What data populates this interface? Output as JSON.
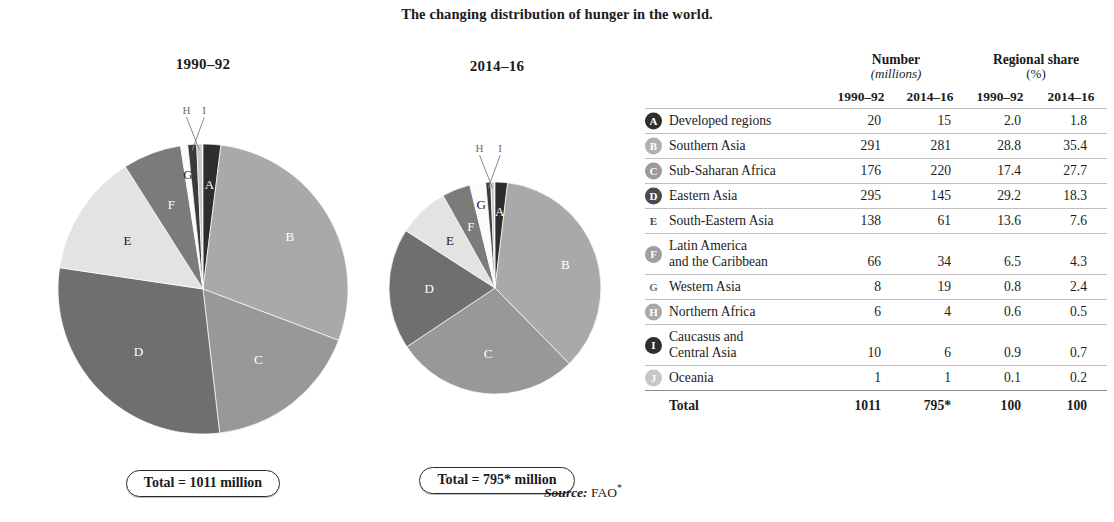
{
  "figure": {
    "title": "The changing distribution of hunger in the world.",
    "source_label": "Source:",
    "source_value": "FAO",
    "source_asterisk": "*"
  },
  "panels": [
    {
      "id": "1990",
      "caption": "1990–92",
      "total_text": "Total = 1011 million"
    },
    {
      "id": "2014",
      "caption": "2014–16",
      "total_text": "Total = 795* million"
    }
  ],
  "table": {
    "group_headers": [
      {
        "title": "Number",
        "sub": "(millions)",
        "sub_italic": true
      },
      {
        "title": "Regional share",
        "sub": "(%)",
        "sub_italic": false
      }
    ],
    "year_headers": [
      "1990–92",
      "2014–16",
      "1990–92",
      "2014–16"
    ],
    "rows": [
      {
        "key": "A",
        "label": "Developed regions",
        "label2": "",
        "n1990": "20",
        "n2014": "15",
        "s1990": "2.0",
        "s2014": "1.8"
      },
      {
        "key": "B",
        "label": "Southern Asia",
        "label2": "",
        "n1990": "291",
        "n2014": "281",
        "s1990": "28.8",
        "s2014": "35.4"
      },
      {
        "key": "C",
        "label": "Sub-Saharan Africa",
        "label2": "",
        "n1990": "176",
        "n2014": "220",
        "s1990": "17.4",
        "s2014": "27.7"
      },
      {
        "key": "D",
        "label": "Eastern Asia",
        "label2": "",
        "n1990": "295",
        "n2014": "145",
        "s1990": "29.2",
        "s2014": "18.3"
      },
      {
        "key": "E",
        "label": "South-Eastern Asia",
        "label2": "",
        "n1990": "138",
        "n2014": "61",
        "s1990": "13.6",
        "s2014": "7.6"
      },
      {
        "key": "F",
        "label": "Latin America",
        "label2": "and the Caribbean",
        "n1990": "66",
        "n2014": "34",
        "s1990": "6.5",
        "s2014": "4.3"
      },
      {
        "key": "G",
        "label": "Western Asia",
        "label2": "",
        "n1990": "8",
        "n2014": "19",
        "s1990": "0.8",
        "s2014": "2.4"
      },
      {
        "key": "H",
        "label": "Northern Africa",
        "label2": "",
        "n1990": "6",
        "n2014": "4",
        "s1990": "0.6",
        "s2014": "0.5"
      },
      {
        "key": "I",
        "label": "Caucasus and",
        "label2": "Central Asia",
        "n1990": "10",
        "n2014": "6",
        "s1990": "0.9",
        "s2014": "0.7"
      },
      {
        "key": "J",
        "label": "Oceania",
        "label2": "",
        "n1990": "1",
        "n2014": "1",
        "s1990": "0.1",
        "s2014": "0.2"
      }
    ],
    "total_row": {
      "label": "Total",
      "n1990": "1011",
      "n2014": "795*",
      "s1990": "100",
      "s2014": "100"
    }
  },
  "chart_data": [
    {
      "type": "pie",
      "title": "1990–92",
      "unit": "millions of undernourished people",
      "total": 1011,
      "total_label": "Total = 1011 million",
      "categories": [
        "A",
        "B",
        "C",
        "D",
        "E",
        "F",
        "G",
        "H",
        "I",
        "J"
      ],
      "labels": [
        "Developed regions",
        "Southern Asia",
        "Sub-Saharan Africa",
        "Eastern Asia",
        "South-Eastern Asia",
        "Latin America and the Caribbean",
        "Western Asia",
        "Northern Africa",
        "Caucasus and Central Asia",
        "Oceania"
      ],
      "values": [
        20,
        291,
        176,
        295,
        138,
        66,
        8,
        6,
        10,
        1
      ],
      "percents": [
        2.0,
        28.8,
        17.4,
        29.2,
        13.6,
        6.5,
        0.8,
        0.6,
        0.9,
        0.1
      ],
      "colors": [
        "#2e2e2e",
        "#a9a9a9",
        "#989898",
        "#6f6f6f",
        "#e3e3e3",
        "#7b7b7b",
        "#fbfbfb",
        "#c9c9c9",
        "#3a3a3a",
        "#d6d6d6"
      ],
      "draw_order": [
        "A",
        "B",
        "C",
        "D",
        "E",
        "F",
        "G",
        "I",
        "H"
      ],
      "legend": "external-table"
    },
    {
      "type": "pie",
      "title": "2014–16",
      "unit": "millions of undernourished people",
      "total": 795,
      "total_label": "Total = 795* million",
      "categories": [
        "A",
        "B",
        "C",
        "D",
        "E",
        "F",
        "G",
        "H",
        "I",
        "J"
      ],
      "labels": [
        "Developed regions",
        "Southern Asia",
        "Sub-Saharan Africa",
        "Eastern Asia",
        "South-Eastern Asia",
        "Latin America and the Caribbean",
        "Western Asia",
        "Northern Africa",
        "Caucasus and Central Asia",
        "Oceania"
      ],
      "values": [
        15,
        281,
        220,
        145,
        61,
        34,
        19,
        4,
        6,
        1
      ],
      "percents": [
        1.8,
        35.4,
        27.7,
        18.3,
        7.6,
        4.3,
        2.4,
        0.5,
        0.7,
        0.2
      ],
      "colors": [
        "#2e2e2e",
        "#a9a9a9",
        "#989898",
        "#6f6f6f",
        "#e3e3e3",
        "#7b7b7b",
        "#fbfbfb",
        "#c9c9c9",
        "#3a3a3a",
        "#d6d6d6"
      ],
      "draw_order": [
        "A",
        "B",
        "C",
        "D",
        "E",
        "F",
        "G",
        "I",
        "H"
      ],
      "legend": "external-table"
    }
  ],
  "style": {
    "badge_colors": {
      "A": "#2e2e2e",
      "B": "#b0b0b0",
      "C": "#9b9b9b",
      "D": "#4a4a4a",
      "E": "#ffffff",
      "F": "#9e9e9e",
      "G": "#ffffff",
      "H": "#a8a8a8",
      "I": "#2e2e2e",
      "J": "#c6c6c6"
    },
    "badge_text_colors": {
      "A": "#ffffff",
      "B": "#ffffff",
      "C": "#ffffff",
      "D": "#ffffff",
      "E": "#4a4a4a",
      "F": "#ffffff",
      "G": "#6e6e6e",
      "H": "#ffffff",
      "I": "#ffffff",
      "J": "#ffffff"
    },
    "pie_geometry": [
      {
        "cx": 175,
        "cy": 216,
        "r": 145
      },
      {
        "cx": 123,
        "cy": 213,
        "r": 106
      }
    ],
    "leader_labels": [
      "H",
      "I"
    ]
  }
}
